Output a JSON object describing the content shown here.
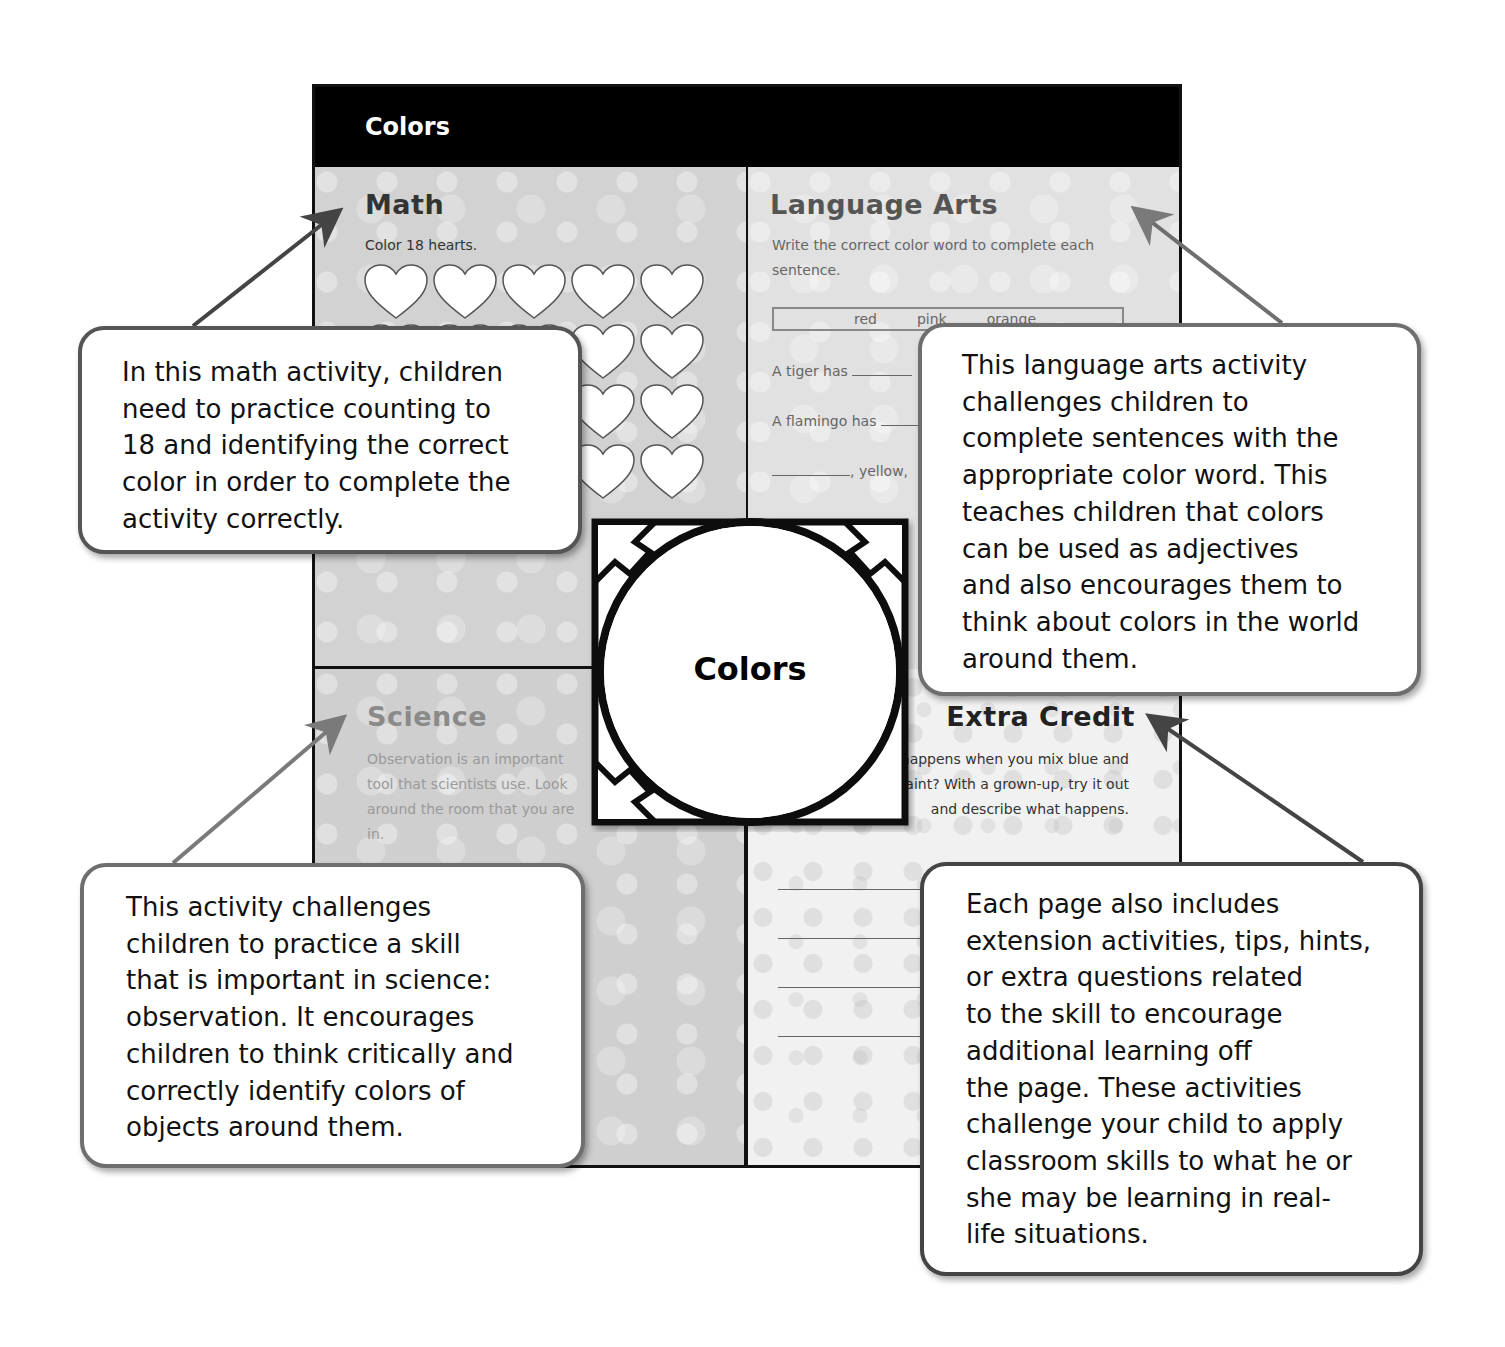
{
  "page": {
    "banner_title": "Colors",
    "center_label": "Colors"
  },
  "sections": {
    "math": {
      "title": "Math",
      "instruction": "Color 18 hearts.",
      "heart_count_visible": 20
    },
    "language_arts": {
      "title": "Language Arts",
      "instruction": "Write the correct color word to complete each sentence.",
      "word_bank": [
        "red",
        "pink",
        "orange"
      ],
      "sentences": [
        {
          "prefix": "A tiger has"
        },
        {
          "prefix": "A flamingo has"
        },
        {
          "prefix": ", yellow,"
        }
      ]
    },
    "science": {
      "title": "Science",
      "text": "Observation is an important tool that scientists use. Look around the room that you are in."
    },
    "extra_credit": {
      "title": "Extra Credit",
      "text": "What happens when you mix blue and yellow paint? With a grown-up, try it out and describe what happens.",
      "answer_lines": 4
    }
  },
  "callouts": {
    "math": "In this math activity, children\nneed to practice counting to\n18 and identifying the correct\ncolor in order to complete the\nactivity correctly.",
    "language_arts": "This language arts activity\nchallenges children to\ncomplete sentences with the\nappropriate color word. This\nteaches children that colors\ncan be used as adjectives\nand also encourages them to\nthink about colors in the world\naround them.",
    "science": "This activity challenges\nchildren to practice a skill\nthat is important in science:\nobservation. It encourages\nchildren to think critically and\ncorrectly identify colors of\nobjects around them.",
    "extra_credit": "Each page also includes\nextension activities, tips, hints,\nor extra questions related\nto the skill to encourage\nadditional learning off\nthe page. These activities\nchallenge your child to apply\nclassroom skills to what he or\nshe may be learning in real-\nlife situations."
  },
  "colors": {
    "banner": "#000000",
    "arrow_dark": "#444444",
    "arrow_light": "#7a7a7a",
    "callout_border": "#6e6e6e"
  }
}
